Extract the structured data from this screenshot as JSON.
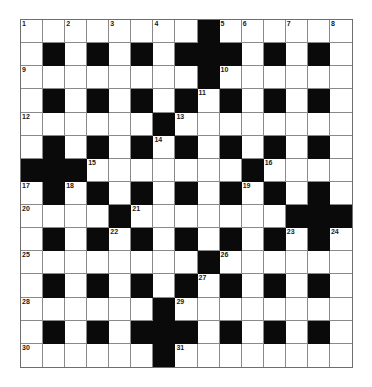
{
  "puzzle": {
    "rows": 15,
    "cols": 15,
    "colors": {
      "block": "#0a0a0a",
      "cell": "#ffffff",
      "grid_line": "#8a8a8a"
    },
    "grid": [
      "1.2.3.4.#56.7.8",
      ".#.#.#.###.#.#.",
      "9.......#A.....",
      ".#.#.#.#B#.#.#.",
      "C.....#D.......",
      ".#.#.#E#.#.#.#.",
      "###F......#G...",
      "H#I#.#.#.#J#.#.",
      "K...#L......###",
      ".#.#M#.#.#.#N#O",
      "P.......#Q.....",
      ".#.#.#.#R#.#.#.",
      "S.....#T.......",
      ".#.#.###.#.#.#.",
      "U.....#V......."
    ],
    "number_key": {
      "1": "1",
      "2": "2",
      "3": "3",
      "4": "4",
      "5": "5",
      "6": "6",
      "7": "7",
      "8": "8",
      "9": "9",
      "A": "10",
      "B": "11",
      "C": "12",
      "D": "13",
      "E": "14",
      "F": "15",
      "G": "16",
      "H": "17",
      "I": "18",
      "J": "19",
      "K": "20",
      "L": "21",
      "M": "22",
      "N": "23",
      "O": "24",
      "P": "25",
      "Q": "26",
      "R": "27",
      "S": "28",
      "T": "29",
      "U": "30",
      "V": "31"
    },
    "numbered_cells": [
      {
        "number": "1",
        "row": 0,
        "col": 0
      },
      {
        "number": "2",
        "row": 0,
        "col": 2
      },
      {
        "number": "3",
        "row": 0,
        "col": 4
      },
      {
        "number": "4",
        "row": 0,
        "col": 6
      },
      {
        "number": "5",
        "row": 0,
        "col": 9
      },
      {
        "number": "6",
        "row": 0,
        "col": 10
      },
      {
        "number": "7",
        "row": 0,
        "col": 12
      },
      {
        "number": "8",
        "row": 0,
        "col": 14
      },
      {
        "number": "9",
        "row": 2,
        "col": 0
      },
      {
        "number": "10",
        "row": 2,
        "col": 9
      },
      {
        "number": "11",
        "row": 3,
        "col": 8
      },
      {
        "number": "12",
        "row": 4,
        "col": 0
      },
      {
        "number": "13",
        "row": 4,
        "col": 7
      },
      {
        "number": "14",
        "row": 5,
        "col": 6
      },
      {
        "number": "15",
        "row": 6,
        "col": 3
      },
      {
        "number": "16",
        "row": 6,
        "col": 11
      },
      {
        "number": "17",
        "row": 7,
        "col": 0
      },
      {
        "number": "18",
        "row": 7,
        "col": 2
      },
      {
        "number": "19",
        "row": 7,
        "col": 10
      },
      {
        "number": "20",
        "row": 8,
        "col": 0
      },
      {
        "number": "21",
        "row": 8,
        "col": 5
      },
      {
        "number": "22",
        "row": 9,
        "col": 4
      },
      {
        "number": "23",
        "row": 9,
        "col": 12
      },
      {
        "number": "24",
        "row": 9,
        "col": 14
      },
      {
        "number": "25",
        "row": 10,
        "col": 0
      },
      {
        "number": "26",
        "row": 10,
        "col": 9
      },
      {
        "number": "27",
        "row": 11,
        "col": 8
      },
      {
        "number": "28",
        "row": 12,
        "col": 0
      },
      {
        "number": "29",
        "row": 12,
        "col": 7
      },
      {
        "number": "30",
        "row": 14,
        "col": 0
      },
      {
        "number": "31",
        "row": 14,
        "col": 7
      }
    ]
  }
}
